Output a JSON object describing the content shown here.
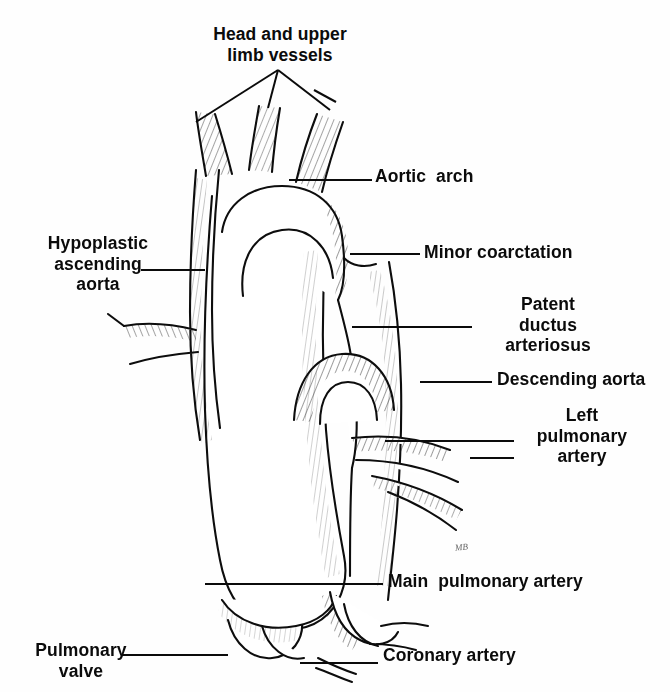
{
  "figure": {
    "background_color": "#fefefe",
    "ink_color": "#0b0b0b",
    "artist_signature": "MB"
  },
  "labels": {
    "head_and_upper_limb_vessels": "Head and upper\nlimb vessels",
    "aortic_arch": "Aortic  arch",
    "hypoplastic_ascending_aorta": "Hypoplastic\nascending\naorta",
    "minor_coarctation": "Minor coarctation",
    "patent_ductus_arteriosus": "Patent\nductus\narteriosus",
    "descending_aorta": "Descending aorta",
    "left_pulmonary_artery": "Left\npulmonary\nartery",
    "main_pulmonary_artery": "Main  pulmonary artery",
    "pulmonary_valve": "Pulmonary\nvalve",
    "coronary_artery": "Coronary artery"
  },
  "structures": [
    "head and upper limb vessels",
    "aortic arch",
    "hypoplastic ascending aorta",
    "minor coarctation",
    "patent ductus arteriosus",
    "descending aorta",
    "left pulmonary artery",
    "main pulmonary artery",
    "pulmonary valve",
    "coronary artery"
  ]
}
